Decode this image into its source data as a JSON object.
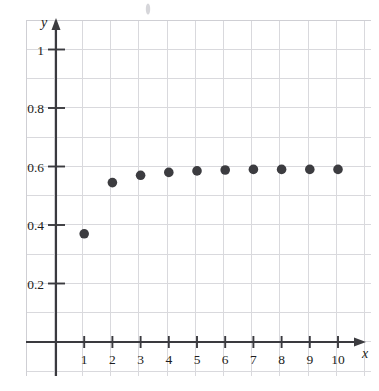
{
  "chart_data": {
    "type": "scatter",
    "title": "",
    "xlabel": "x",
    "ylabel": "y",
    "x": [
      1,
      2,
      3,
      4,
      5,
      6,
      7,
      8,
      9,
      10
    ],
    "values": [
      0.37,
      0.545,
      0.57,
      0.58,
      0.585,
      0.588,
      0.59,
      0.59,
      0.59,
      0.59
    ],
    "series": [
      {
        "name": "series-1",
        "values": [
          0.37,
          0.545,
          0.57,
          0.58,
          0.585,
          0.588,
          0.59,
          0.59,
          0.59,
          0.59
        ]
      }
    ],
    "xlim": [
      0,
      11
    ],
    "ylim": [
      0,
      1.12
    ],
    "xticks": [
      1,
      2,
      3,
      4,
      5,
      6,
      7,
      8,
      9,
      10
    ],
    "xtick_labels": [
      "1",
      "2",
      "3",
      "4",
      "5",
      "6",
      "7",
      "8",
      "9",
      "10"
    ],
    "yticks": [
      0.2,
      0.4,
      0.6,
      0.8,
      1
    ],
    "ytick_labels": [
      "0.2",
      "0.4",
      "0.6",
      "0.8",
      "1"
    ],
    "grid": true,
    "grid_step_x": 1,
    "grid_step_y": 0.1,
    "legend": null,
    "marker": "filled-circle",
    "marker_color": "#3c3c40",
    "grid_color": "#d9d9dd",
    "axis_color": "#3a3a3f",
    "background_color": "#ffffff"
  },
  "axis_labels": {
    "x_axis_name": "x",
    "y_axis_name": "y"
  }
}
